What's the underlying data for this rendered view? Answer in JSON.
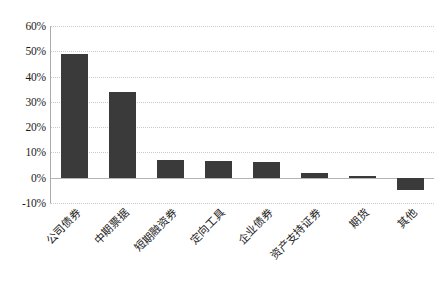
{
  "chart_data": {
    "type": "bar",
    "title": "",
    "subtitle": "",
    "xlabel": "",
    "ylabel": "",
    "categories": [
      "公司债券",
      "中期票据",
      "短期融资券",
      "定向工具",
      "企业债券",
      "资产支持证券",
      "期货",
      "其他"
    ],
    "values": [
      49,
      34,
      7,
      6.5,
      6.3,
      2,
      0.5,
      -4.7
    ],
    "value_labels": [
      "49%",
      "34%",
      "7%",
      "6.5%",
      "6.3%",
      "2%",
      "0.5%",
      "-4.7%"
    ],
    "ylim": [
      -10,
      60
    ],
    "ytick_values": [
      60,
      50,
      40,
      30,
      20,
      10,
      0,
      -10
    ],
    "ytick_labels": [
      "60%",
      "50%",
      "40%",
      "30%",
      "20%",
      "10%",
      "0%",
      "-10%"
    ],
    "grid": true,
    "legend": false,
    "legend_position": "none",
    "bar_color": "#3a3a3a",
    "gridline_color": "#c9c9c9",
    "axis_color": "#aaaaaa",
    "background_color": "#ffffff",
    "xtick_rotation": -45
  }
}
